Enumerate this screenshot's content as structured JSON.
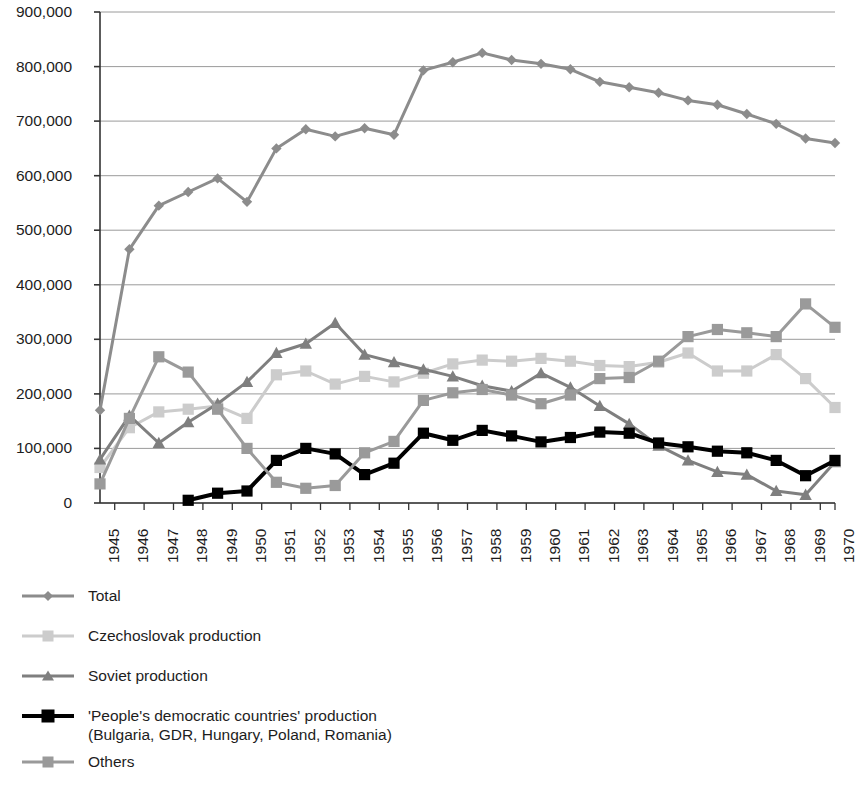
{
  "chart_data": {
    "type": "line",
    "title": "",
    "subtitle": "",
    "xlabel": "",
    "ylabel": "",
    "x": [
      1945,
      1946,
      1947,
      1948,
      1949,
      1950,
      1951,
      1952,
      1953,
      1954,
      1955,
      1956,
      1957,
      1958,
      1959,
      1960,
      1961,
      1962,
      1963,
      1964,
      1965,
      1966,
      1967,
      1968,
      1969,
      1970
    ],
    "categories": [
      "1945",
      "1946",
      "1947",
      "1948",
      "1949",
      "1950",
      "1951",
      "1952",
      "1953",
      "1954",
      "1955",
      "1956",
      "1957",
      "1958",
      "1959",
      "1960",
      "1961",
      "1962",
      "1963",
      "1964",
      "1965",
      "1966",
      "1967",
      "1968",
      "1969",
      "1970"
    ],
    "xlim": [
      1945,
      1970
    ],
    "ylim": [
      0,
      900000
    ],
    "yticks": [
      0,
      100000,
      200000,
      300000,
      400000,
      500000,
      600000,
      700000,
      800000,
      900000
    ],
    "ytick_labels": [
      "0",
      "100,000",
      "200,000",
      "300,000",
      "400,000",
      "500,000",
      "600,000",
      "700,000",
      "800,000",
      "900,000"
    ],
    "grid": true,
    "grid_axis": "y",
    "legend_position": "below",
    "series": [
      {
        "name": "Total",
        "color": "#8c8c8c",
        "marker": "diamond",
        "line_width": 3,
        "values": [
          170000,
          465000,
          545000,
          570000,
          595000,
          552000,
          650000,
          685000,
          672000,
          687000,
          675000,
          793000,
          808000,
          825000,
          812000,
          805000,
          795000,
          772000,
          762000,
          752000,
          738000,
          730000,
          713000,
          695000,
          668000,
          660000
        ]
      },
      {
        "name": "Czechoslovak production",
        "color": "#cccccc",
        "marker": "square",
        "line_width": 3,
        "values": [
          65000,
          138000,
          167000,
          172000,
          178000,
          155000,
          235000,
          242000,
          218000,
          232000,
          222000,
          238000,
          255000,
          262000,
          260000,
          265000,
          260000,
          252000,
          250000,
          258000,
          275000,
          242000,
          242000,
          272000,
          228000,
          175000
        ]
      },
      {
        "name": "Soviet production",
        "color": "#7f7f7f",
        "marker": "triangle",
        "line_width": 3,
        "values": [
          80000,
          160000,
          110000,
          148000,
          182000,
          222000,
          275000,
          292000,
          330000,
          272000,
          258000,
          245000,
          232000,
          215000,
          205000,
          238000,
          212000,
          178000,
          145000,
          105000,
          78000,
          57000,
          52000,
          22000,
          15000,
          75000
        ]
      },
      {
        "name": "'People's democratic countries' production\n(Bulgaria, GDR, Hungary, Poland, Romania)",
        "color": "#000000",
        "marker": "square",
        "line_width": 4,
        "values": [
          null,
          null,
          null,
          5000,
          18000,
          22000,
          78000,
          100000,
          90000,
          52000,
          73000,
          128000,
          115000,
          133000,
          123000,
          112000,
          120000,
          130000,
          128000,
          110000,
          103000,
          95000,
          92000,
          78000,
          50000,
          78000
        ]
      },
      {
        "name": "Others",
        "color": "#9a9a9a",
        "marker": "square",
        "line_width": 3,
        "values": [
          35000,
          155000,
          268000,
          240000,
          172000,
          100000,
          38000,
          27000,
          32000,
          92000,
          113000,
          188000,
          202000,
          208000,
          198000,
          182000,
          198000,
          228000,
          230000,
          260000,
          305000,
          318000,
          312000,
          305000,
          365000,
          322000
        ]
      }
    ]
  },
  "legend": {
    "items": [
      {
        "label": "Total",
        "swatch": "diamond-marker-icon"
      },
      {
        "label": "Czechoslovak production",
        "swatch": "square-marker-icon"
      },
      {
        "label": "Soviet production",
        "swatch": "triangle-marker-icon"
      },
      {
        "label": "'People's democratic countries' production\n(Bulgaria, GDR, Hungary, Poland, Romania)",
        "swatch": "square-marker-icon"
      },
      {
        "label": "Others",
        "swatch": "square-marker-icon"
      }
    ]
  },
  "axis": {
    "y_labels": [
      "900,000",
      "800,000",
      "700,000",
      "600,000",
      "500,000",
      "400,000",
      "300,000",
      "200,000",
      "100,000",
      "0"
    ],
    "x_labels": [
      "1945",
      "1946",
      "1947",
      "1948",
      "1949",
      "1950",
      "1951",
      "1952",
      "1953",
      "1954",
      "1955",
      "1956",
      "1957",
      "1958",
      "1959",
      "1960",
      "1961",
      "1962",
      "1963",
      "1964",
      "1965",
      "1966",
      "1967",
      "1968",
      "1969",
      "1970"
    ]
  }
}
